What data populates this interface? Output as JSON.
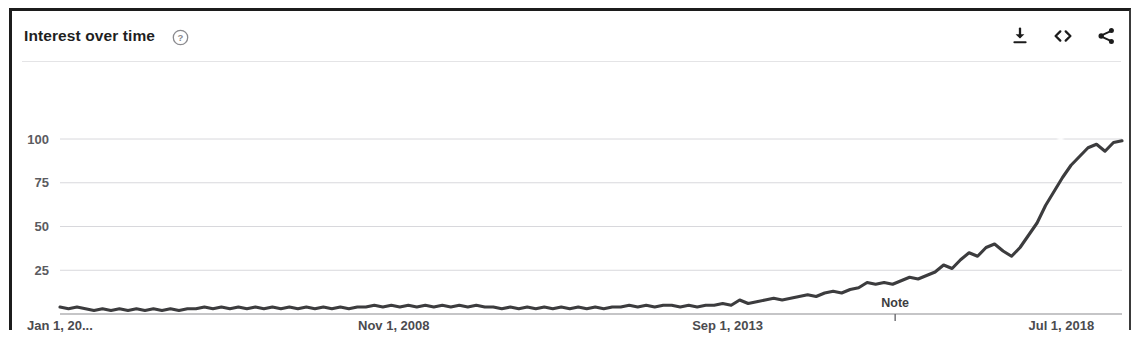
{
  "card": {
    "header": {
      "title": "Interest over time",
      "help_icon": "help-circle-icon",
      "actions": [
        {
          "name": "download-icon",
          "label": "Download"
        },
        {
          "name": "embed-icon",
          "label": "<>"
        },
        {
          "name": "share-icon",
          "label": "Share"
        }
      ]
    }
  },
  "chart_data": {
    "type": "line",
    "title": "Interest over time",
    "xlabel": "",
    "ylabel": "",
    "ylim": [
      0,
      105
    ],
    "yticks": [
      25,
      50,
      75,
      100
    ],
    "ytick_labels": [
      "25",
      "50",
      "75",
      "100"
    ],
    "grid": true,
    "legend": null,
    "xtick_labels": [
      "Jan 1, 20...",
      "Nov 1, 2008",
      "Sep 1, 2013",
      "Jul 1, 2018"
    ],
    "xtick_positions": [
      0,
      0.3143,
      0.6286,
      0.9429
    ],
    "annotations": [
      {
        "label": "Note",
        "x_fraction": 0.7864
      }
    ],
    "x": [
      0.0,
      0.008,
      0.016,
      0.024,
      0.032,
      0.04,
      0.048,
      0.056,
      0.064,
      0.072,
      0.08,
      0.088,
      0.096,
      0.104,
      0.112,
      0.12,
      0.128,
      0.136,
      0.144,
      0.152,
      0.16,
      0.168,
      0.176,
      0.184,
      0.192,
      0.2,
      0.208,
      0.216,
      0.224,
      0.232,
      0.24,
      0.248,
      0.256,
      0.264,
      0.272,
      0.28,
      0.288,
      0.296,
      0.304,
      0.312,
      0.32,
      0.328,
      0.336,
      0.344,
      0.352,
      0.36,
      0.368,
      0.376,
      0.384,
      0.392,
      0.4,
      0.408,
      0.416,
      0.424,
      0.432,
      0.44,
      0.448,
      0.456,
      0.464,
      0.472,
      0.48,
      0.488,
      0.496,
      0.504,
      0.512,
      0.52,
      0.528,
      0.536,
      0.544,
      0.552,
      0.56,
      0.568,
      0.576,
      0.584,
      0.592,
      0.6,
      0.608,
      0.616,
      0.624,
      0.632,
      0.64,
      0.648,
      0.656,
      0.664,
      0.672,
      0.68,
      0.688,
      0.696,
      0.704,
      0.712,
      0.72,
      0.728,
      0.736,
      0.744,
      0.752,
      0.76,
      0.768,
      0.776,
      0.784,
      0.792,
      0.8,
      0.808,
      0.816,
      0.824,
      0.832,
      0.84,
      0.848,
      0.856,
      0.864,
      0.872,
      0.88,
      0.888,
      0.896,
      0.904,
      0.912,
      0.92,
      0.928,
      0.936,
      0.944,
      0.952,
      0.96,
      0.968,
      0.976,
      0.984,
      0.992,
      1.0
    ],
    "values": [
      4,
      3,
      4,
      3,
      2,
      3,
      2,
      3,
      2,
      3,
      2,
      3,
      2,
      3,
      2,
      3,
      3,
      4,
      3,
      4,
      3,
      4,
      3,
      4,
      3,
      4,
      3,
      4,
      3,
      4,
      3,
      4,
      3,
      4,
      3,
      4,
      4,
      5,
      4,
      5,
      4,
      5,
      4,
      5,
      4,
      5,
      4,
      5,
      4,
      5,
      4,
      4,
      3,
      4,
      3,
      4,
      3,
      4,
      3,
      4,
      3,
      4,
      3,
      4,
      3,
      4,
      4,
      5,
      4,
      5,
      4,
      5,
      5,
      4,
      5,
      4,
      5,
      5,
      6,
      5,
      8,
      6,
      7,
      8,
      9,
      8,
      9,
      10,
      11,
      10,
      12,
      13,
      12,
      14,
      15,
      18,
      17,
      18,
      17,
      19,
      21,
      20,
      22,
      24,
      28,
      26,
      31,
      35,
      33,
      38,
      40,
      36,
      33,
      38,
      45,
      52,
      62,
      70,
      78,
      85,
      90,
      95,
      97,
      93,
      98,
      99
    ]
  }
}
